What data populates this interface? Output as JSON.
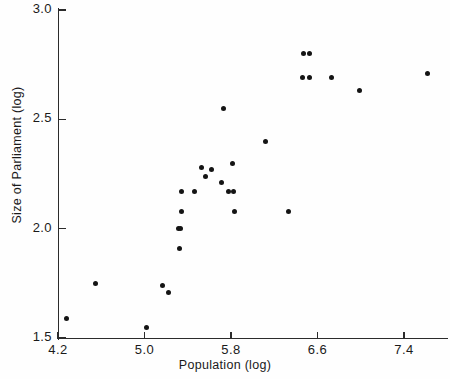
{
  "figure": {
    "y_axis_title": "Size of Parliament (log)",
    "x_axis_title": "Population (log)",
    "caption": ""
  },
  "chart_data": {
    "type": "scatter",
    "title": "",
    "xlabel": "Population (log)",
    "ylabel": "Size of Parliament (log)",
    "xlim": [
      4.2,
      7.72
    ],
    "ylim": [
      1.5,
      3.0
    ],
    "xticks": [
      4.2,
      5.0,
      5.8,
      6.6,
      7.4
    ],
    "xtick_labels": [
      "4.2",
      "5.0",
      "5.8",
      "6.6",
      "7.4"
    ],
    "yticks": [
      1.5,
      2.0,
      2.5,
      3.0
    ],
    "ytick_labels": [
      "1.5",
      "2.0",
      "2.5",
      "3.0"
    ],
    "grid": false,
    "legend": null,
    "marker": "filled-circle",
    "marker_color": "#141414",
    "points": [
      {
        "x": 4.28,
        "y": 1.59
      },
      {
        "x": 4.55,
        "y": 1.75
      },
      {
        "x": 5.02,
        "y": 1.55
      },
      {
        "x": 5.17,
        "y": 1.74
      },
      {
        "x": 5.22,
        "y": 1.71
      },
      {
        "x": 5.32,
        "y": 1.91
      },
      {
        "x": 5.31,
        "y": 2.0
      },
      {
        "x": 5.33,
        "y": 2.0
      },
      {
        "x": 5.34,
        "y": 2.08
      },
      {
        "x": 5.34,
        "y": 2.17
      },
      {
        "x": 5.46,
        "y": 2.17
      },
      {
        "x": 5.53,
        "y": 2.28
      },
      {
        "x": 5.56,
        "y": 2.24
      },
      {
        "x": 5.62,
        "y": 2.27
      },
      {
        "x": 5.71,
        "y": 2.21
      },
      {
        "x": 5.73,
        "y": 2.55
      },
      {
        "x": 5.78,
        "y": 2.17
      },
      {
        "x": 5.81,
        "y": 2.3
      },
      {
        "x": 5.82,
        "y": 2.17
      },
      {
        "x": 5.83,
        "y": 2.08
      },
      {
        "x": 6.12,
        "y": 2.4
      },
      {
        "x": 6.33,
        "y": 2.08
      },
      {
        "x": 6.47,
        "y": 2.8
      },
      {
        "x": 6.53,
        "y": 2.8
      },
      {
        "x": 6.46,
        "y": 2.69
      },
      {
        "x": 6.53,
        "y": 2.69
      },
      {
        "x": 6.73,
        "y": 2.69
      },
      {
        "x": 6.99,
        "y": 2.63
      },
      {
        "x": 7.62,
        "y": 2.71
      }
    ]
  }
}
